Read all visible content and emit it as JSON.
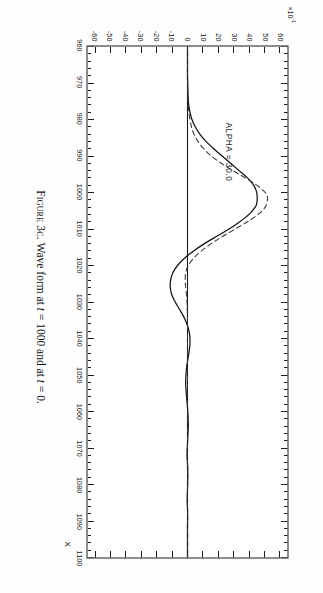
{
  "figure": {
    "caption_prefix": "Figure 3c.",
    "caption_text_1": " Wave form at ",
    "caption_var_1": "t",
    "caption_text_2": " = 1000 and at ",
    "caption_var_2": "t",
    "caption_text_3": " = 0.",
    "caption_full": "Figure 3c. Wave form at t = 1000 and at t = 0.",
    "orientation": "rotated-90-clockwise"
  },
  "annotation": {
    "alpha_label": "ALPHA = 30.0"
  },
  "axes": {
    "x_title": "X",
    "y_exponent_mantissa": "×10",
    "y_exponent_power": "-1"
  },
  "colors": {
    "ink": "#1a1a1a",
    "paper": "#fefefe",
    "curve_solid": "#111111",
    "curve_dashed": "#333333"
  },
  "chart_data": {
    "type": "line",
    "title": "Wave form at t = 1000 and at t = 0.",
    "xlabel": "X",
    "ylabel": "",
    "y_scale_note": "×10^-1",
    "xlim": [
      960,
      1100
    ],
    "ylim": [
      -65,
      65
    ],
    "grid": false,
    "legend_position": "none",
    "x_ticks": [
      960,
      970,
      980,
      990,
      1000,
      1010,
      1020,
      1030,
      1040,
      1050,
      1060,
      1070,
      1080,
      1090,
      1100
    ],
    "x_tick_labels": [
      "960",
      "970",
      "980",
      "990",
      "1000",
      "1010",
      "1020",
      "1030",
      "1040",
      "1050",
      "1060",
      "1070",
      "1080",
      "1090",
      "1100"
    ],
    "y_ticks": [
      60,
      50,
      40,
      30,
      20,
      10,
      0,
      -10,
      -20,
      -30,
      -40,
      -50,
      -60
    ],
    "y_tick_labels": [
      "60",
      "50",
      "40",
      "30",
      "20",
      "10",
      "0",
      "-10",
      "-20",
      "-30",
      "-40",
      "-50",
      "-60"
    ],
    "x_minor_tick_step": 2,
    "y_minor_tick_step": 10,
    "annotations": [
      {
        "text": "ALPHA = 30.0",
        "x": 982,
        "y": 38
      }
    ],
    "series": [
      {
        "name": "wave form at t = 1000",
        "style": "solid",
        "x": [
          960,
          962,
          964,
          966,
          968,
          970,
          972,
          974,
          976,
          978,
          980,
          982,
          984,
          986,
          988,
          990,
          992,
          994,
          996,
          998,
          1000,
          1002,
          1003,
          1004,
          1006,
          1008,
          1010,
          1012,
          1014,
          1016,
          1018,
          1020,
          1022,
          1024,
          1026,
          1028,
          1030,
          1032,
          1034,
          1036,
          1038,
          1040,
          1042,
          1044,
          1046,
          1048,
          1050,
          1052,
          1054,
          1056,
          1058,
          1060,
          1064,
          1068,
          1072,
          1076,
          1080,
          1084,
          1088,
          1092,
          1096,
          1100
        ],
        "y": [
          0,
          0,
          0,
          0,
          0,
          0.1,
          0.2,
          0.4,
          0.8,
          1.6,
          2.9,
          5.0,
          8.0,
          12.0,
          17.0,
          22.5,
          28.0,
          33.5,
          39.0,
          43.0,
          45.0,
          45.3,
          45.0,
          44.0,
          40.0,
          34.0,
          27.0,
          19.0,
          11.0,
          4.0,
          -2.0,
          -6.5,
          -9.5,
          -11.0,
          -11.2,
          -10.2,
          -8.0,
          -5.2,
          -2.5,
          -0.4,
          1.0,
          1.6,
          1.5,
          0.9,
          0.1,
          -0.6,
          -1.0,
          -1.2,
          -1.0,
          -0.6,
          -0.2,
          0.2,
          0.5,
          0.1,
          -0.3,
          0.2,
          0.1,
          -0.2,
          0.1,
          0.0,
          0.0,
          0.0
        ]
      },
      {
        "name": "wave form at t = 0",
        "style": "dashed",
        "x": [
          960,
          965,
          970,
          974,
          978,
          982,
          984,
          986,
          988,
          990,
          992,
          994,
          996,
          998,
          1000,
          1001,
          1002,
          1004,
          1006,
          1008,
          1010,
          1012,
          1014,
          1016,
          1018,
          1020,
          1022,
          1024,
          1026,
          1028,
          1030,
          1035,
          1040,
          1050,
          1060,
          1080,
          1100
        ],
        "y": [
          0,
          0,
          0.1,
          0.3,
          0.9,
          2.6,
          4.2,
          6.8,
          10.5,
          15.5,
          22.0,
          29.5,
          37.5,
          45.0,
          50.5,
          51.8,
          52.0,
          50.5,
          46.0,
          39.0,
          31.0,
          23.0,
          15.5,
          9.0,
          4.0,
          0.5,
          -1.2,
          -1.5,
          -1.2,
          -0.7,
          -0.3,
          0.0,
          0.0,
          0.0,
          0.0,
          0.0,
          0.0
        ]
      }
    ]
  }
}
